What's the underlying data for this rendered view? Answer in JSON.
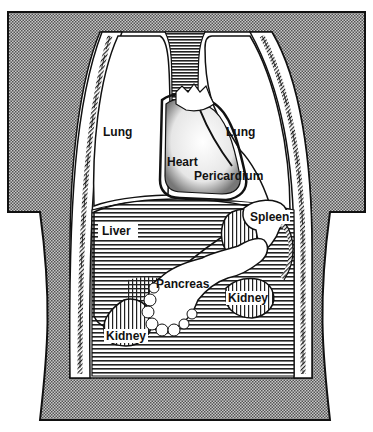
{
  "diagram": {
    "labels": {
      "lung_left": "Lung",
      "lung_right": "Lung",
      "heart": "Heart",
      "pericardium": "Pericardium",
      "liver": "Liver",
      "spleen": "Spleen",
      "pancreas": "Pancreas",
      "kidney_left": "Kidney",
      "kidney_right": "Kidney"
    },
    "colors": {
      "body_fill": "#8a8a8a",
      "outline": "#111111",
      "organ_white": "#ffffff",
      "hatch_line": "#222222"
    }
  }
}
